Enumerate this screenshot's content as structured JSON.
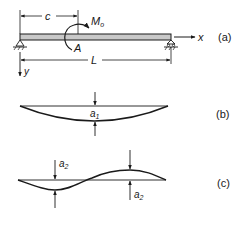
{
  "figure": {
    "panel_a": {
      "tag": "(a)",
      "dimension_c": "c",
      "moment_label": "M",
      "moment_subscript": "o",
      "point_label": "A",
      "span_label": "L",
      "x_axis_label": "x",
      "y_axis_label": "y"
    },
    "panel_b": {
      "tag": "(b)",
      "amplitude_label": "a",
      "amplitude_subscript": "1"
    },
    "panel_c": {
      "tag": "(c)",
      "amplitude_label_left": "a",
      "amplitude_subscript_left": "2",
      "amplitude_label_right": "a",
      "amplitude_subscript_right": "2"
    }
  },
  "colors": {
    "ink": "#1a1a1a",
    "beam_fill": "#c8c8c8"
  }
}
